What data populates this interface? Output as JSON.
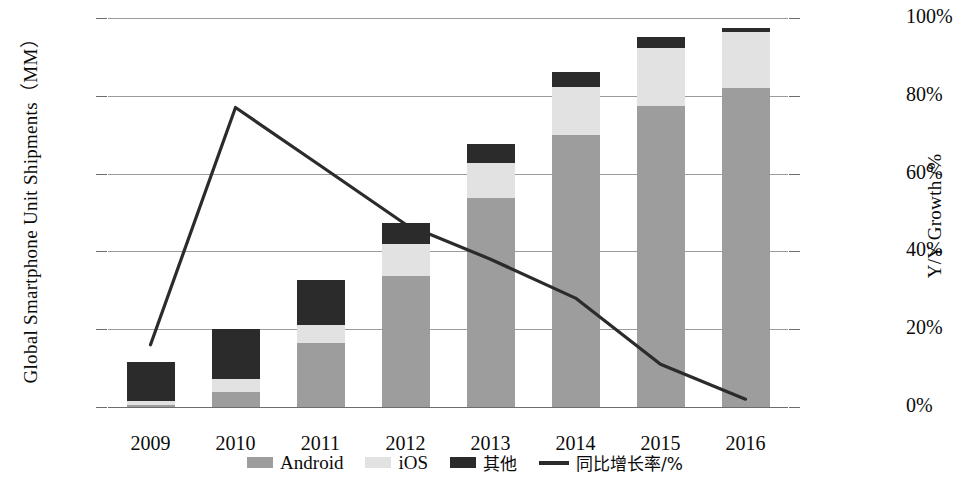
{
  "chart_data": {
    "type": "bar",
    "title": "",
    "subtitle": "",
    "categories": [
      "2009",
      "2010",
      "2011",
      "2012",
      "2013",
      "2014",
      "2015",
      "2016"
    ],
    "xlabel": "",
    "ylabel": "Global Smartphone Unit Shipments（MM）",
    "y2label": "Y/Y Growth /%",
    "ylim": [
      0,
      1500
    ],
    "yticks": [
      0,
      300,
      600,
      900,
      1200,
      1500
    ],
    "ytick_labels": [
      "0",
      "300",
      "600",
      "900",
      "1200",
      "1500"
    ],
    "y2lim": [
      0,
      100
    ],
    "y2ticks": [
      0,
      20,
      40,
      60,
      80,
      100
    ],
    "y2tick_labels": [
      "0%",
      "20%",
      "40%",
      "60%",
      "80%",
      "100%"
    ],
    "grid": true,
    "stacked": true,
    "legend_position": "bottom",
    "series": [
      {
        "name": "Android",
        "type": "bar",
        "color": "#9d9d9d",
        "values": [
          7,
          58,
          245,
          505,
          805,
          1050,
          1160,
          1230
        ]
      },
      {
        "name": "iOS",
        "type": "bar",
        "color": "#e2e2e2",
        "values": [
          18,
          50,
          70,
          125,
          135,
          185,
          225,
          215
        ]
      },
      {
        "name": "其他",
        "type": "bar",
        "color": "#2b2b2b",
        "values": [
          147,
          192,
          175,
          80,
          75,
          55,
          40,
          15
        ]
      },
      {
        "name": "同比增长率/%",
        "type": "line",
        "color": "#2b2b2b",
        "axis": "right",
        "values": [
          16,
          77,
          62,
          47,
          38,
          28,
          11,
          2
        ]
      }
    ],
    "totals": [
      172,
      300,
      490,
      710,
      1015,
      1290,
      1425,
      1460
    ],
    "legend": [
      {
        "label": "Android",
        "marker": "square",
        "color": "#9d9d9d"
      },
      {
        "label": "iOS",
        "marker": "square",
        "color": "#e2e2e2"
      },
      {
        "label": "其他",
        "marker": "square",
        "color": "#2b2b2b"
      },
      {
        "label": "同比增长率/%",
        "marker": "line",
        "color": "#2b2b2b"
      }
    ]
  }
}
